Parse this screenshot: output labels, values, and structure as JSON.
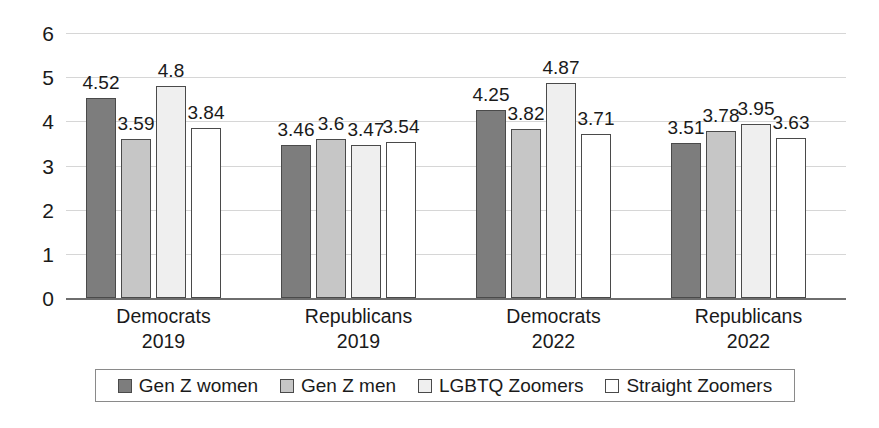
{
  "chart_data": {
    "type": "bar",
    "title": "",
    "subtitle": "",
    "xlabel": "",
    "ylabel": "",
    "ylim": [
      0,
      6
    ],
    "ytick_step": 1,
    "yticks": [
      "0",
      "1",
      "2",
      "3",
      "4",
      "5",
      "6"
    ],
    "grid": true,
    "legend_position": "bottom",
    "categories": [
      "Democrats 2019",
      "Republicans 2019",
      "Democrats 2022",
      "Republicans 2022"
    ],
    "category_lines": [
      [
        "Democrats",
        "2019"
      ],
      [
        "Republicans",
        "2019"
      ],
      [
        "Democrats",
        "2022"
      ],
      [
        "Republicans",
        "2022"
      ]
    ],
    "series": [
      {
        "name": "Gen Z women",
        "color": "#7d7d7d",
        "values": [
          4.52,
          3.46,
          4.25,
          3.51
        ],
        "labels": [
          "4.52",
          "3.46",
          "4.25",
          "3.51"
        ]
      },
      {
        "name": "Gen Z men",
        "color": "#c6c6c6",
        "values": [
          3.59,
          3.6,
          3.82,
          3.78
        ],
        "labels": [
          "3.59",
          "3.6",
          "3.82",
          "3.78"
        ]
      },
      {
        "name": "LGBTQ Zoomers",
        "color": "#efefef",
        "values": [
          4.8,
          3.47,
          4.87,
          3.95
        ],
        "labels": [
          "4.8",
          "3.47",
          "4.87",
          "3.95"
        ]
      },
      {
        "name": "Straight Zoomers",
        "color": "#ffffff",
        "values": [
          3.84,
          3.54,
          3.71,
          3.63
        ],
        "labels": [
          "3.84",
          "3.54",
          "3.71",
          "3.63"
        ]
      }
    ]
  },
  "colors": {
    "axis": "#6e6e6e",
    "gridline": "#d6d6d6",
    "bar_border": "#4a4a4a",
    "text": "#1a1a1a",
    "legend_border": "#8a8a8a",
    "background": "#ffffff"
  }
}
